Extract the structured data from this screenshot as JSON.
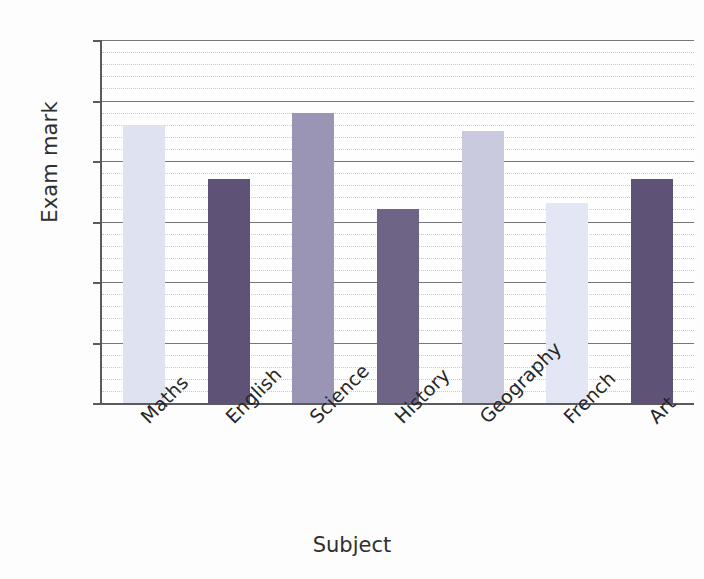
{
  "chart_data": {
    "type": "bar",
    "title": "",
    "xlabel": "Subject",
    "ylabel": "Exam mark",
    "categories": [
      "Maths",
      "English",
      "Science",
      "History",
      "Geography",
      "French",
      "Art"
    ],
    "values": [
      46,
      37,
      48,
      32,
      45,
      33,
      37
    ],
    "ylim": [
      0,
      60
    ],
    "y_major_ticks": [
      0,
      10,
      20,
      30,
      40,
      50,
      60
    ],
    "y_tick_labels": [
      "0",
      "10",
      "20",
      "30",
      "40",
      "50",
      "60"
    ],
    "y_major_step": 10,
    "y_minor_step": 2,
    "grid": "horizontal major solid and minor dotted",
    "legend": "none",
    "bar_colors": [
      "#dfe3f1",
      "#5f5277",
      "#9a95b4",
      "#6e6485",
      "#c9cade",
      "#e3e7f5",
      "#5f5277"
    ],
    "series": [
      {
        "name": "Exam mark",
        "points": [
          {
            "category": "Maths",
            "value": 46,
            "color": "#dfe3f1"
          },
          {
            "category": "English",
            "value": 37,
            "color": "#5f5277"
          },
          {
            "category": "Science",
            "value": 48,
            "color": "#9a95b4"
          },
          {
            "category": "History",
            "value": 32,
            "color": "#6e6485"
          },
          {
            "category": "Geography",
            "value": 45,
            "color": "#c9cade"
          },
          {
            "category": "French",
            "value": 33,
            "color": "#e3e7f5"
          },
          {
            "category": "Art",
            "value": 37,
            "color": "#5f5277"
          }
        ]
      }
    ],
    "axis_color": "#5a5a5f",
    "gridline_major_color": "#75757c",
    "gridline_minor_color": "#c9c9d6",
    "background_color": "#fdfdfd"
  }
}
